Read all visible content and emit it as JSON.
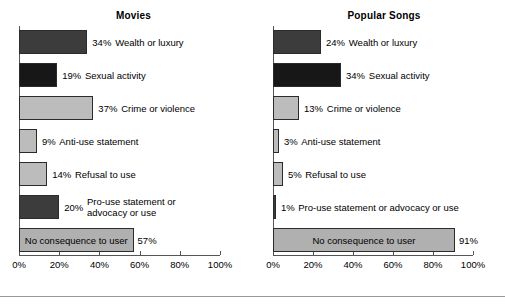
{
  "figure": {
    "background_color": "#ffffff",
    "footer_rule_color": "#999999"
  },
  "axis": {
    "tick_labels": [
      "0%",
      "20%",
      "40%",
      "60%",
      "80%",
      "100%"
    ],
    "tick_values": [
      0,
      20,
      40,
      60,
      80,
      100
    ],
    "min": 0,
    "max": 100,
    "line_color": "#555555"
  },
  "panels": [
    {
      "title": "Movies",
      "bars": [
        {
          "label": "Wealth or luxury",
          "value": 34,
          "value_text": "34%",
          "color": "#3c3c3c",
          "label_inside": false
        },
        {
          "label": "Sexual activity",
          "value": 19,
          "value_text": "19%",
          "color": "#171717",
          "label_inside": false
        },
        {
          "label": "Crime or violence",
          "value": 37,
          "value_text": "37%",
          "color": "#bcbcbc",
          "label_inside": false
        },
        {
          "label": "Anti-use statement",
          "value": 9,
          "value_text": "9%",
          "color": "#bcbcbc",
          "label_inside": false
        },
        {
          "label": "Refusal to use",
          "value": 14,
          "value_text": "14%",
          "color": "#bcbcbc",
          "label_inside": false
        },
        {
          "label": "Pro-use statement or advocacy or use",
          "label_line1": "Pro-use statement or",
          "label_line2": "advocacy or use",
          "value": 20,
          "value_text": "20%",
          "color": "#3c3c3c",
          "label_inside": false
        },
        {
          "label": "No consequence to user",
          "value": 57,
          "value_text": "57%",
          "color": "#b0b0b0",
          "label_inside": true
        }
      ]
    },
    {
      "title": "Popular Songs",
      "bars": [
        {
          "label": "Wealth or luxury",
          "value": 24,
          "value_text": "24%",
          "color": "#3c3c3c",
          "label_inside": false
        },
        {
          "label": "Sexual activity",
          "value": 34,
          "value_text": "34%",
          "color": "#171717",
          "label_inside": false
        },
        {
          "label": "Crime or violence",
          "value": 13,
          "value_text": "13%",
          "color": "#bcbcbc",
          "label_inside": false
        },
        {
          "label": "Anti-use statement",
          "value": 3,
          "value_text": "3%",
          "color": "#bcbcbc",
          "label_inside": false
        },
        {
          "label": "Refusal to use",
          "value": 5,
          "value_text": "5%",
          "color": "#bcbcbc",
          "label_inside": false
        },
        {
          "label": "Pro-use statement or advocacy or use",
          "value": 1,
          "value_text": "1%",
          "color": "#3c3c3c",
          "label_inside": false
        },
        {
          "label": "No consequence to user",
          "value": 91,
          "value_text": "91%",
          "color": "#b0b0b0",
          "label_inside": true
        }
      ]
    }
  ],
  "chart_data": {
    "type": "bar",
    "orientation": "horizontal",
    "title": "",
    "xlabel": "",
    "ylabel": "",
    "xlim": [
      0,
      100
    ],
    "xticks": [
      0,
      20,
      40,
      60,
      80,
      100
    ],
    "xtick_labels": [
      "0%",
      "20%",
      "40%",
      "60%",
      "80%",
      "100%"
    ],
    "grid": false,
    "legend": "none",
    "categories": [
      "Wealth or luxury",
      "Sexual activity",
      "Crime or violence",
      "Anti-use statement",
      "Refusal to use",
      "Pro-use statement or advocacy or use",
      "No consequence to user"
    ],
    "series": [
      {
        "name": "Movies",
        "values": [
          34,
          19,
          37,
          9,
          14,
          20,
          57
        ]
      },
      {
        "name": "Popular Songs",
        "values": [
          24,
          34,
          13,
          3,
          5,
          1,
          91
        ]
      }
    ]
  }
}
